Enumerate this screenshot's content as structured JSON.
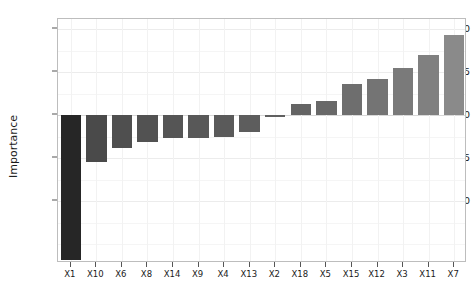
{
  "chart_data": {
    "type": "bar",
    "title": "",
    "subtitle": "",
    "xlabel": "",
    "ylabel": "Importance",
    "categories": [
      "X1",
      "X10",
      "X6",
      "X8",
      "X14",
      "X9",
      "X4",
      "X13",
      "X2",
      "X18",
      "X5",
      "X15",
      "X12",
      "X3",
      "X11",
      "X7"
    ],
    "values": [
      -8.4,
      -2.7,
      -1.9,
      -1.55,
      -1.35,
      -1.3,
      -1.25,
      -1.0,
      -0.1,
      0.65,
      0.85,
      1.8,
      2.1,
      2.75,
      3.5,
      4.65
    ],
    "bar_colors": [
      "#262626",
      "#4a4a4a",
      "#4f4f4f",
      "#525252",
      "#555555",
      "#585858",
      "#5a5a5a",
      "#5d5d5d",
      "#606060",
      "#646464",
      "#686868",
      "#6e6e6e",
      "#747474",
      "#7a7a7a",
      "#808080",
      "#8a8a8a"
    ],
    "ylim": [
      -8.6,
      5.6
    ],
    "yticks": [
      5.0,
      2.5,
      0.0,
      -2.5,
      -5.0
    ],
    "ytick_labels": [
      "5.0",
      "2.5",
      "0.0",
      "-2.5",
      "-5.0"
    ],
    "grid": true,
    "legend": "none",
    "axis_color": "#bdbdbd",
    "grid_color": "#ececec",
    "background": "#ffffff"
  }
}
